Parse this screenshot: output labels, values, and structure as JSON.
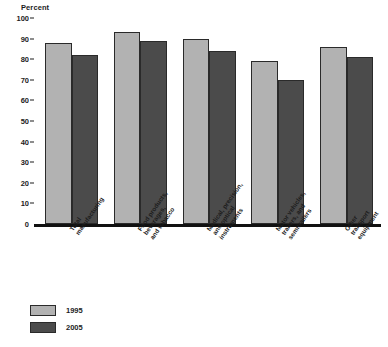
{
  "chart_data": {
    "type": "bar",
    "title": "",
    "subtitle": "",
    "xlabel": "",
    "ylabel": "Percent",
    "ylim": [
      0,
      100
    ],
    "yticks": [
      0,
      10,
      20,
      30,
      40,
      50,
      60,
      70,
      80,
      90,
      100
    ],
    "grid": false,
    "legend_position": "bottom-left",
    "categories": [
      "Total manufacturing",
      "Food products, beverages, and tobacco",
      "Medical, precision, and optical instruments",
      "Motor vehicles, trailers, and semitrailers",
      "Other transport equipment"
    ],
    "category_lines": [
      [
        "Total",
        "manufacturing"
      ],
      [
        "Food products,",
        "beverages,",
        "and tobacco"
      ],
      [
        "Medical, precision,",
        "and optical",
        "instruments"
      ],
      [
        "Motor vehicles,",
        "trailers, and",
        "semitrailers"
      ],
      [
        "Other",
        "transport",
        "equipment"
      ]
    ],
    "series": [
      {
        "name": "1995",
        "color": "#b2b2b2",
        "values": [
          88,
          93,
          90,
          79,
          86
        ]
      },
      {
        "name": "2005",
        "color": "#4b4b4b",
        "values": [
          82,
          89,
          84,
          70,
          81
        ]
      }
    ]
  },
  "legend": {
    "items": [
      {
        "label": "1995",
        "color": "#b2b2b2"
      },
      {
        "label": "2005",
        "color": "#4b4b4b"
      }
    ]
  }
}
